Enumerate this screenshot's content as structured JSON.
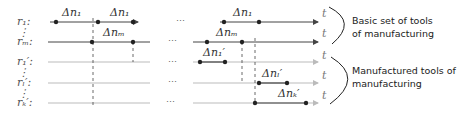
{
  "diagram": {
    "row_labels": [
      "r₁:",
      "⋮",
      "rₘ:",
      "r₁′:",
      "⋮",
      "rₗ′:",
      "⋮",
      "rₖ′:"
    ],
    "rows": [
      {
        "id": "r1",
        "label": "r₁:"
      },
      {
        "id": "rm",
        "label": "rₘ:"
      },
      {
        "id": "r1p",
        "label": "r₁′:"
      },
      {
        "id": "rlp",
        "label": "rₗ′:"
      },
      {
        "id": "rkp",
        "label": "rₖ′:"
      }
    ],
    "interval_labels": {
      "r1_a": "Δn₁",
      "r1_b": "Δn₁",
      "rm_a": "Δnₘ",
      "r1_c": "Δn₁",
      "rm_b": "Δnₘ",
      "r1p": "Δn₁′",
      "rlp": "Δnₗ′",
      "rkp": "Δnₖ′"
    },
    "ellipsis": "…",
    "time_label": "t",
    "group_labels": {
      "basic_line1": "Basic set of tools",
      "basic_line2": "of manufacturing",
      "manufactured_line1": "Manufactured tools of",
      "manufactured_line2": "manufacturing"
    },
    "colors": {
      "main_line": "#444444",
      "light_line": "#bbbbbb",
      "dot": "#222222"
    }
  }
}
